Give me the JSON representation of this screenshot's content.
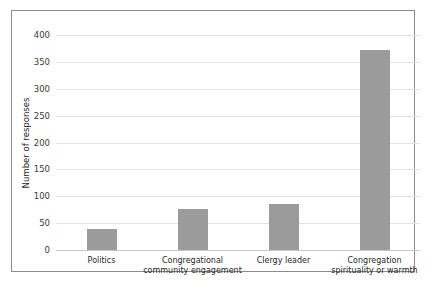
{
  "chart_data": {
    "type": "bar",
    "title": "",
    "xlabel": "",
    "ylabel": "Number of responses",
    "categories": [
      "Politics",
      "Congregational\ncommunity engagement",
      "Clergy leader",
      "Congregation\nspirituality or warmth"
    ],
    "category_lines": [
      [
        "Politics"
      ],
      [
        "Congregational",
        "community engagement"
      ],
      [
        "Clergy leader"
      ],
      [
        "Congregation",
        "spirituality or warmth"
      ]
    ],
    "values": [
      39,
      77,
      85,
      373
    ],
    "ylim": [
      0,
      400
    ],
    "yticks": [
      0,
      50,
      100,
      150,
      200,
      250,
      300,
      350,
      400
    ],
    "ytick_labels": [
      "0",
      "50",
      "100",
      "150",
      "200",
      "250",
      "300",
      "350",
      "400"
    ],
    "grid": true,
    "legend": "none",
    "bar_color": "#9b9b9b",
    "grid_color": "#e3e3e3",
    "axis_color": "#c8c8c8",
    "frame_color": "#8c8c8c",
    "background_color": "#ffffff"
  }
}
